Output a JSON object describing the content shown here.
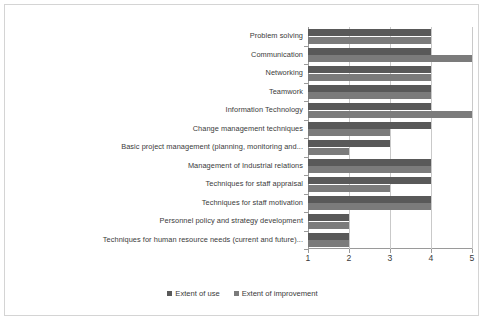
{
  "chart_data": {
    "type": "bar",
    "orientation": "horizontal",
    "title": "",
    "xlabel": "",
    "ylabel": "",
    "xlim": [
      1,
      5
    ],
    "xticks": [
      1,
      2,
      3,
      4,
      5
    ],
    "xtick_labels": [
      "1",
      "2",
      "3",
      "4",
      "5"
    ],
    "grid": true,
    "grid_axis": "x",
    "legend_position": "bottom",
    "categories": [
      "Problem solving",
      "Communication",
      "Networking",
      "Teamwork",
      "Information Technology",
      "Change management techniques",
      "Basic project management (planning, monitoring and...",
      "Management of Industrial relations",
      "Techniques for staff appraisal",
      "Techniques for staff motivation",
      "Personnel policy and strategy development",
      "Techniques for human resource needs (current and future)..."
    ],
    "series": [
      {
        "name": "Extent of use",
        "color": "#595959",
        "values": [
          4,
          4,
          4,
          4,
          4,
          4,
          3,
          4,
          4,
          4,
          2,
          2
        ]
      },
      {
        "name": "Extent of improvement",
        "color": "#7b7b7b",
        "values": [
          4,
          5,
          4,
          4,
          5,
          3,
          2,
          4,
          3,
          4,
          2,
          2
        ]
      }
    ]
  },
  "legend": {
    "items": [
      {
        "label": "Extent of use",
        "color": "#595959"
      },
      {
        "label": "Extent of improvement",
        "color": "#7b7b7b"
      }
    ]
  }
}
